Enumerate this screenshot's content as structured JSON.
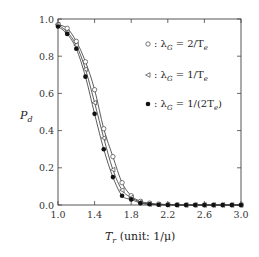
{
  "chart_data": {
    "type": "line",
    "title": "",
    "xlabel": "T_r (unit: 1/μ)",
    "ylabel": "P_d",
    "xlim": [
      1.0,
      3.0
    ],
    "ylim": [
      0.0,
      1.0
    ],
    "xticks": [
      "1.0",
      "1.4",
      "1.8",
      "2.2",
      "2.6",
      "3.0"
    ],
    "yticks": [
      "0.0",
      "0.2",
      "0.4",
      "0.6",
      "0.8",
      "1.0"
    ],
    "grid": false,
    "legend_position": "upper right (inside)",
    "x": [
      1.0,
      1.1,
      1.2,
      1.3,
      1.4,
      1.5,
      1.6,
      1.7,
      1.8,
      1.9,
      2.0,
      2.1,
      2.2,
      2.3,
      2.4,
      2.5,
      2.6,
      2.7,
      2.8,
      2.9,
      3.0
    ],
    "series": [
      {
        "name": "λ_G = 2/T_e",
        "marker": "open-circle",
        "values": [
          0.97,
          0.95,
          0.88,
          0.77,
          0.62,
          0.41,
          0.26,
          0.12,
          0.05,
          0.02,
          0.01,
          0.005,
          0.002,
          0.001,
          0.0,
          0.0,
          0.0,
          0.0,
          0.0,
          0.0,
          0.0
        ]
      },
      {
        "name": "λ_G = 1/T_e",
        "marker": "open-triangle-left",
        "values": [
          0.97,
          0.93,
          0.86,
          0.73,
          0.55,
          0.36,
          0.19,
          0.08,
          0.04,
          0.015,
          0.005,
          0.002,
          0.001,
          0.0,
          0.0,
          0.0,
          0.0,
          0.0,
          0.0,
          0.0,
          0.0
        ]
      },
      {
        "name": "λ_G = 1/(2T_e)",
        "marker": "filled-circle",
        "values": [
          0.96,
          0.92,
          0.84,
          0.69,
          0.49,
          0.3,
          0.15,
          0.05,
          0.03,
          0.01,
          0.004,
          0.001,
          0.0,
          0.0,
          0.0,
          0.0,
          0.0,
          0.0,
          0.0,
          0.0,
          0.0
        ]
      }
    ]
  },
  "legend": [
    {
      "symbol": "○",
      "label": ": λ",
      "sub": "G",
      "rest": " = 2/T",
      "sub2": "e",
      "tail": ""
    },
    {
      "symbol": "◃",
      "label": ": λ",
      "sub": "G",
      "rest": " = 1/T",
      "sub2": "e",
      "tail": ""
    },
    {
      "symbol": "●",
      "label": ": λ",
      "sub": "G",
      "rest": " = 1/(2T",
      "sub2": "e",
      "tail": ")"
    }
  ],
  "axes": {
    "ylabel_main": "P",
    "ylabel_sub": "d",
    "xlabel_main": "T",
    "xlabel_sub": "r",
    "xlabel_rest": " (unit: 1/μ)"
  }
}
